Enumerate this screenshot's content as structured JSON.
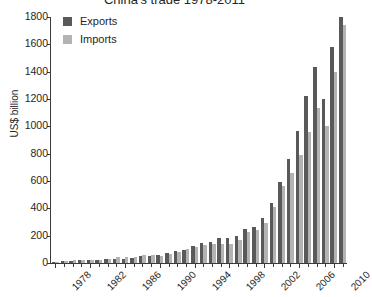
{
  "chart_data": {
    "type": "bar",
    "title": "China's trade 1978-2011",
    "xlabel": "",
    "ylabel": "US$ billion",
    "ylim": [
      0,
      1800
    ],
    "ytick_step": 200,
    "yticks": [
      0,
      200,
      400,
      600,
      800,
      1000,
      1200,
      1400,
      1600,
      1800
    ],
    "grid": false,
    "legend_position": "top-left",
    "categories": [
      "1978",
      "1979",
      "1980",
      "1981",
      "1982",
      "1983",
      "1984",
      "1985",
      "1986",
      "1987",
      "1988",
      "1989",
      "1990",
      "1991",
      "1992",
      "1993",
      "1994",
      "1995",
      "1996",
      "1997",
      "1998",
      "1999",
      "2000",
      "2001",
      "2002",
      "2003",
      "2004",
      "2005",
      "2006",
      "2007",
      "2008",
      "2009",
      "2010",
      "2011"
    ],
    "xtick_labels": [
      "1978",
      "1982",
      "1986",
      "1990",
      "1994",
      "1998",
      "2002",
      "2006",
      "2010"
    ],
    "xtick_categories": [
      "1978",
      "1982",
      "1986",
      "1990",
      "1994",
      "1998",
      "2002",
      "2006",
      "2010"
    ],
    "series": [
      {
        "name": "Exports",
        "color": "#595959",
        "values": [
          10,
          14,
          18,
          22,
          22,
          22,
          26,
          27,
          31,
          39,
          48,
          53,
          62,
          72,
          85,
          92,
          121,
          149,
          151,
          183,
          184,
          195,
          249,
          266,
          326,
          438,
          593,
          762,
          969,
          1220,
          1431,
          1202,
          1578,
          1899
        ]
      },
      {
        "name": "Imports",
        "color": "#b3b3b3",
        "values": [
          11,
          16,
          20,
          22,
          19,
          21,
          27,
          42,
          43,
          43,
          55,
          59,
          53,
          64,
          81,
          104,
          116,
          132,
          139,
          142,
          140,
          166,
          225,
          244,
          295,
          413,
          561,
          660,
          791,
          956,
          1133,
          1006,
          1396,
          1743
        ]
      }
    ]
  },
  "legend": {
    "items": [
      {
        "label": "Exports",
        "swatch_class": "exports"
      },
      {
        "label": "Imports",
        "swatch_class": "imports"
      }
    ]
  },
  "axes": {
    "y_title": "US$ billion"
  }
}
